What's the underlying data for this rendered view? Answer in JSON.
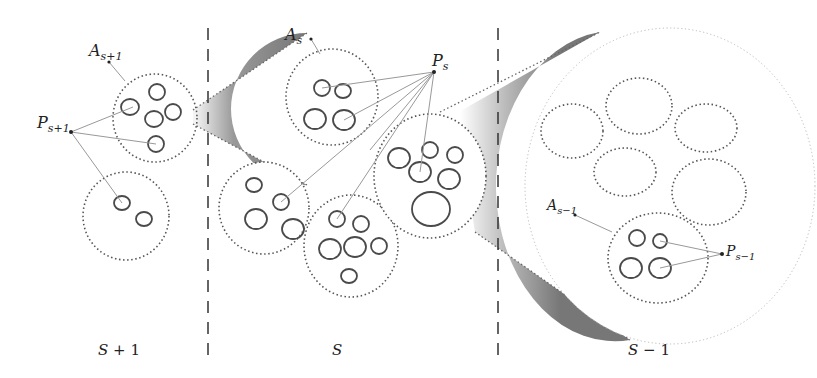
{
  "diagram": {
    "point_labels": {
      "A_s_plus_1": {
        "main": "A",
        "sub": "s+1"
      },
      "P_s_plus_1": {
        "main": "P",
        "sub": "s+1"
      },
      "A_s": {
        "main": "A",
        "sub": "s"
      },
      "P_s": {
        "main": "P",
        "sub": "s"
      },
      "A_s_minus_1": {
        "main": "A",
        "sub": "s−1"
      },
      "P_s_minus_1": {
        "main": "P",
        "sub": "s−1"
      }
    },
    "scale_labels": {
      "left": {
        "main": "S",
        "suffix": " + 1"
      },
      "middle": {
        "main": "S",
        "suffix": ""
      },
      "right": {
        "main": "S",
        "suffix": " − 1"
      }
    },
    "colors": {
      "circle_stroke": "#555555",
      "dotted_stroke": "#666666",
      "leader_line": "#999999",
      "cone_dark": "#777777",
      "divider": "#333333"
    }
  }
}
